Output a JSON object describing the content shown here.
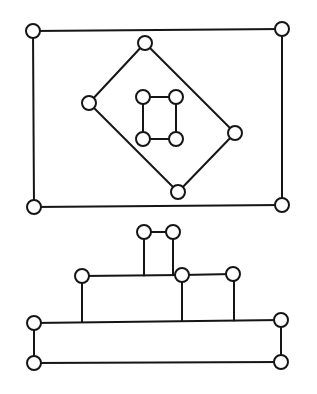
{
  "figure": {
    "width": 317,
    "height": 394,
    "stroke_color": "#151515",
    "node_fill": "#ffffff",
    "node_radius": 7
  },
  "diagrams": [
    {
      "name": "nested-rectangles-graph",
      "nodes": [
        {
          "id": "outer-tl",
          "x": 33,
          "y": 31
        },
        {
          "id": "outer-tr",
          "x": 282,
          "y": 29
        },
        {
          "id": "outer-bl",
          "x": 34,
          "y": 207
        },
        {
          "id": "outer-br",
          "x": 282,
          "y": 205
        },
        {
          "id": "mid-top",
          "x": 145,
          "y": 43
        },
        {
          "id": "mid-left",
          "x": 89,
          "y": 103
        },
        {
          "id": "mid-right",
          "x": 235,
          "y": 133
        },
        {
          "id": "mid-bottom",
          "x": 178,
          "y": 192
        },
        {
          "id": "inner-tl",
          "x": 143,
          "y": 97
        },
        {
          "id": "inner-tr",
          "x": 176,
          "y": 97
        },
        {
          "id": "inner-bl",
          "x": 143,
          "y": 139
        },
        {
          "id": "inner-br",
          "x": 176,
          "y": 139
        }
      ],
      "edges": [
        [
          "outer-tl",
          "outer-tr"
        ],
        [
          "outer-tr",
          "outer-br"
        ],
        [
          "outer-br",
          "outer-bl"
        ],
        [
          "outer-bl",
          "outer-tl"
        ],
        [
          "mid-top",
          "mid-right"
        ],
        [
          "mid-right",
          "mid-bottom"
        ],
        [
          "mid-bottom",
          "mid-left"
        ],
        [
          "mid-left",
          "mid-top"
        ],
        [
          "inner-tl",
          "inner-tr"
        ],
        [
          "inner-tr",
          "inner-br"
        ],
        [
          "inner-br",
          "inner-bl"
        ],
        [
          "inner-bl",
          "inner-tl"
        ]
      ]
    },
    {
      "name": "stacked-tree-graph",
      "nodes": [
        {
          "id": "top-left",
          "x": 144,
          "y": 232
        },
        {
          "id": "top-right",
          "x": 173,
          "y": 232
        },
        {
          "id": "mid-left",
          "x": 82,
          "y": 276
        },
        {
          "id": "mid-center",
          "x": 182,
          "y": 275
        },
        {
          "id": "mid-right",
          "x": 233,
          "y": 274
        },
        {
          "id": "base-tl",
          "x": 34,
          "y": 323
        },
        {
          "id": "base-tr",
          "x": 281,
          "y": 320
        },
        {
          "id": "base-bl",
          "x": 34,
          "y": 363
        },
        {
          "id": "base-br",
          "x": 281,
          "y": 362
        }
      ],
      "segments": [
        {
          "x1": 144,
          "y1": 232,
          "x2": 173,
          "y2": 232
        },
        {
          "x1": 144,
          "y1": 232,
          "x2": 144,
          "y2": 275.5
        },
        {
          "x1": 173,
          "y1": 232,
          "x2": 173,
          "y2": 275
        },
        {
          "x1": 82,
          "y1": 276,
          "x2": 182,
          "y2": 275
        },
        {
          "x1": 182,
          "y1": 275,
          "x2": 233,
          "y2": 274
        },
        {
          "x1": 82,
          "y1": 276,
          "x2": 82,
          "y2": 322
        },
        {
          "x1": 182,
          "y1": 275,
          "x2": 182,
          "y2": 321
        },
        {
          "x1": 234,
          "y1": 274,
          "x2": 234,
          "y2": 320.5
        },
        {
          "x1": 34,
          "y1": 323,
          "x2": 281,
          "y2": 320
        },
        {
          "x1": 34,
          "y1": 323,
          "x2": 34,
          "y2": 363
        },
        {
          "x1": 281,
          "y1": 320,
          "x2": 281,
          "y2": 362
        },
        {
          "x1": 34,
          "y1": 363,
          "x2": 281,
          "y2": 362
        }
      ]
    }
  ]
}
